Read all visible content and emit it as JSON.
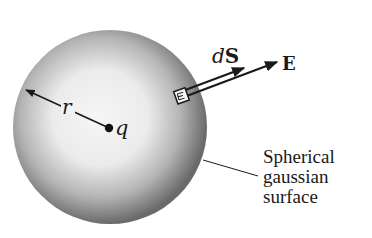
{
  "figure": {
    "type": "gauss-law-sphere",
    "sphere": {
      "label": "Spherical gaussian surface",
      "center_x": 110,
      "center_y": 127,
      "radius": 97
    },
    "charge": {
      "label": "q",
      "x": 109,
      "y": 128
    },
    "radius_label": "r",
    "area_element_label": "dS",
    "area_element_label_parts": {
      "prefix": "d",
      "vector": "S"
    },
    "field_label": "E",
    "caption_lines": [
      "Spherical",
      "gaussian",
      "surface"
    ]
  },
  "colors": {
    "background": "#ffffff",
    "sphere_light": "#f4f4f4",
    "sphere_dark": "#6e6e6e",
    "ink": "#1a1a1a"
  }
}
